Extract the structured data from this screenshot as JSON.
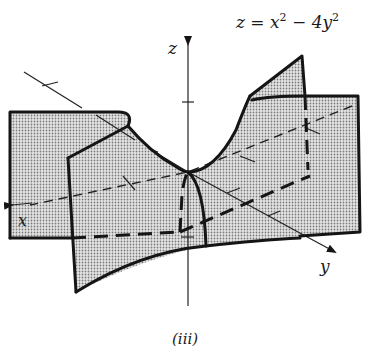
{
  "figure": {
    "equation": {
      "lhs": "z = x",
      "exp1": "2",
      "mid": " − 4y",
      "exp2": "2"
    },
    "axes": {
      "z_label": "z",
      "x_label": "x",
      "y_label": "y"
    },
    "caption": "(iii)",
    "colors": {
      "ink": "#151515",
      "shading": "#9a9a9a",
      "background": "#ffffff"
    },
    "surface": "hyperbolic paraboloid (saddle)"
  }
}
